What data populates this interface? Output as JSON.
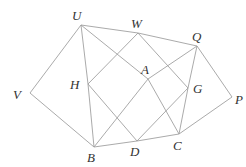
{
  "diagram": {
    "type": "geometry-figure",
    "line_color": "#a0a0a0",
    "label_color": "#333333",
    "points": {
      "U": {
        "x": 81,
        "y": 25,
        "label": "U",
        "lx": 72,
        "ly": 20
      },
      "W": {
        "x": 138,
        "y": 33,
        "label": "W",
        "lx": 131,
        "ly": 28
      },
      "Q": {
        "x": 197,
        "y": 46,
        "label": "Q",
        "lx": 192,
        "ly": 41
      },
      "V": {
        "x": 30,
        "y": 93,
        "label": "V",
        "lx": 13,
        "ly": 99
      },
      "H": {
        "x": 88,
        "y": 84,
        "label": "H",
        "lx": 70,
        "ly": 89
      },
      "A": {
        "x": 148,
        "y": 79,
        "label": "A",
        "lx": 141,
        "ly": 74
      },
      "G": {
        "x": 188,
        "y": 88,
        "label": "G",
        "lx": 193,
        "ly": 93
      },
      "P": {
        "x": 232,
        "y": 97,
        "label": "P",
        "lx": 235,
        "ly": 104
      },
      "B": {
        "x": 94,
        "y": 147,
        "label": "B",
        "lx": 87,
        "ly": 162
      },
      "D": {
        "x": 137,
        "y": 141,
        "label": "D",
        "lx": 130,
        "ly": 156
      },
      "C": {
        "x": 179,
        "y": 134,
        "label": "C",
        "lx": 173,
        "ly": 150
      }
    },
    "segments": [
      [
        "U",
        "W"
      ],
      [
        "W",
        "Q"
      ],
      [
        "Q",
        "G"
      ],
      [
        "G",
        "C"
      ],
      [
        "C",
        "D"
      ],
      [
        "D",
        "B"
      ],
      [
        "B",
        "H"
      ],
      [
        "H",
        "U"
      ],
      [
        "U",
        "A"
      ],
      [
        "A",
        "C"
      ],
      [
        "Q",
        "A"
      ],
      [
        "A",
        "B"
      ],
      [
        "H",
        "W"
      ],
      [
        "W",
        "G"
      ],
      [
        "G",
        "D"
      ],
      [
        "D",
        "H"
      ],
      [
        "U",
        "V"
      ],
      [
        "V",
        "B"
      ],
      [
        "Q",
        "P"
      ],
      [
        "P",
        "C"
      ]
    ]
  }
}
